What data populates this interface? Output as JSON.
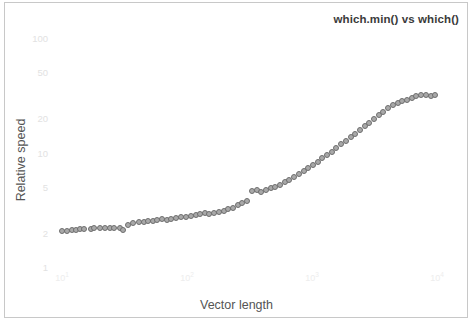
{
  "chart_data": {
    "type": "scatter",
    "title": "which.min() vs which()",
    "xlabel": "Vector length",
    "ylabel": "Relative speed",
    "xscale": "log",
    "yscale": "log",
    "xlim": [
      10,
      10000
    ],
    "ylim": [
      1,
      100
    ],
    "grid": false,
    "legend": null,
    "x_tick_labels": [
      "10",
      "10",
      "10",
      "10"
    ],
    "x_tick_exponents": [
      "1",
      "2",
      "3",
      "4"
    ],
    "x_tick_values": [
      10,
      100,
      1000,
      10000
    ],
    "y_tick_labels": [
      "100",
      "50",
      "20",
      "10",
      "5",
      "2",
      "1"
    ],
    "y_tick_values": [
      100,
      50,
      20,
      10,
      5,
      2,
      1
    ],
    "marker": {
      "shape": "circle",
      "fill_color": "#a9a9a9",
      "edge_color": "#6e6e6e",
      "size_px": 6
    },
    "x": [
      10,
      11,
      12,
      13,
      14,
      15,
      17,
      18,
      20,
      22,
      24,
      26,
      29,
      31,
      34,
      37,
      41,
      45,
      49,
      53,
      58,
      63,
      69,
      75,
      82,
      90,
      98,
      107,
      117,
      127,
      139,
      151,
      165,
      180,
      196,
      214,
      233,
      254,
      277,
      302,
      330,
      360,
      392,
      428,
      467,
      509,
      555,
      605,
      660,
      720,
      785,
      856,
      933,
      1018,
      1110,
      1210,
      1320,
      1440,
      1570,
      1710,
      1870,
      2040,
      2220,
      2420,
      2640,
      2880,
      3140,
      3420,
      3730,
      4070,
      4440,
      4840,
      5280,
      5760,
      6280,
      6850,
      7470,
      8140,
      8880,
      9680
    ],
    "y": [
      2.05,
      2.08,
      2.1,
      2.12,
      2.13,
      2.15,
      2.16,
      2.18,
      2.19,
      2.2,
      2.2,
      2.2,
      2.18,
      2.1,
      2.35,
      2.4,
      2.45,
      2.48,
      2.5,
      2.52,
      2.58,
      2.62,
      2.55,
      2.6,
      2.68,
      2.72,
      2.76,
      2.8,
      2.86,
      2.92,
      2.96,
      2.9,
      2.95,
      3.0,
      3.1,
      3.2,
      3.3,
      3.45,
      3.6,
      3.75,
      4.6,
      4.75,
      4.5,
      4.7,
      4.85,
      5.0,
      5.2,
      5.5,
      5.8,
      6.1,
      6.5,
      6.9,
      7.3,
      7.8,
      8.3,
      8.9,
      9.5,
      10.2,
      11.0,
      11.8,
      12.7,
      13.6,
      14.6,
      15.7,
      16.9,
      18.2,
      19.6,
      21.1,
      22.7,
      24.5,
      26.0,
      27.0,
      28.2,
      29.0,
      30.0,
      31.0,
      32.0,
      31.5,
      31.0,
      32.0
    ]
  },
  "plot": {
    "title": "which.min() vs which()",
    "x_axis_title": "Vector length",
    "y_axis_title": "Relative speed"
  }
}
